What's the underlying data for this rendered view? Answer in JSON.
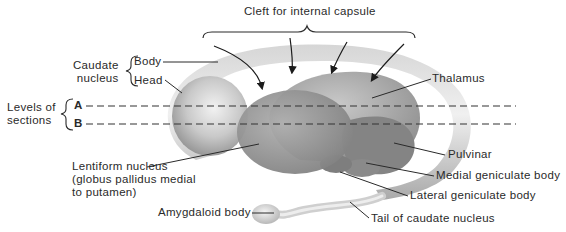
{
  "figure": {
    "title": "Cleft for internal capsule",
    "colors": {
      "background": "#ffffff",
      "caudate_light": "#e4e4e4",
      "caudate_mid": "#bdbdbd",
      "caudate_dark": "#8e8e8e",
      "thalamus": "#a6a6a6",
      "lentiform": "#9a9a9a",
      "pulvinar": "#858585",
      "line": "#2a2a2a"
    }
  },
  "labels": {
    "caudate_group": "Caudate\nnucleus",
    "caudate_body": "Body",
    "caudate_head": "Head",
    "levels_group": "Levels of\nsections",
    "level_a": "A",
    "level_b": "B",
    "lentiform": "Lentiform nucleus\n(globus pallidus medial\nto putamen)",
    "amygdaloid": "Amygdaloid body",
    "thalamus": "Thalamus",
    "pulvinar": "Pulvinar",
    "medial_geniculate": "Medial geniculate body",
    "lateral_geniculate": "Lateral geniculate body",
    "tail_caudate": "Tail of caudate nucleus"
  }
}
